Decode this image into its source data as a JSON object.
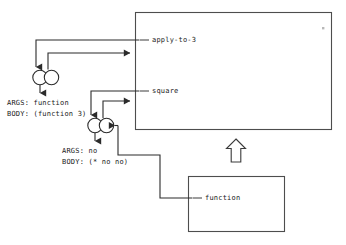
{
  "diagram": {
    "colors": {
      "background": "#ffffff",
      "stroke": "#2b2b2b",
      "box_stroke": "#4d4d4d",
      "text": "#1a1a1a"
    },
    "global_frame": {
      "name": "global-environment-box",
      "bindings": [
        {
          "name": "apply-to-3",
          "label": "apply-to-3"
        },
        {
          "name": "square",
          "label": "square"
        }
      ]
    },
    "function_frame": {
      "name": "function-environment-box",
      "bindings": [
        {
          "name": "function",
          "label": "function"
        }
      ]
    },
    "procedures": [
      {
        "id": "apply-to-3-procedure",
        "args_label": "ARGS: function",
        "body_label": "BODY: (function 3)"
      },
      {
        "id": "square-procedure",
        "args_label": "ARGS: no",
        "body_label": "BODY: (* no no)"
      }
    ],
    "arrows": {
      "env_pointer_up": "hollow-up-arrow"
    }
  }
}
